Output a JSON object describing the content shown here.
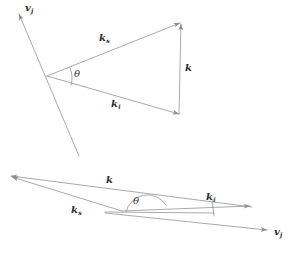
{
  "figure": {
    "stroke_color": "#9a9a9a",
    "label_color": "#2b2b2b",
    "background": "#ffffff"
  },
  "top_diagram": {
    "name": "upper-vector-triangle",
    "labels": {
      "vj": {
        "base": "v",
        "sub": "j"
      },
      "ks": {
        "base": "k",
        "sub": "s"
      },
      "ki": {
        "base": "k",
        "sub": "i"
      },
      "k": {
        "base": "k",
        "sub": ""
      },
      "theta": "θ"
    }
  },
  "bottom_diagram": {
    "name": "lower-vector-triangle",
    "labels": {
      "k": {
        "base": "k",
        "sub": ""
      },
      "ks": {
        "base": "k",
        "sub": "s"
      },
      "ki": {
        "base": "k",
        "sub": "i"
      },
      "vj": {
        "base": "v",
        "sub": "j"
      },
      "theta": "θ"
    }
  }
}
